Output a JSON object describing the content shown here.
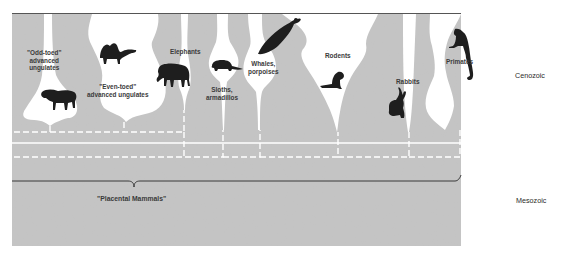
{
  "diagram": {
    "colors": {
      "background": "#c4c4c4",
      "lineage": "#ffffff",
      "silhouette": "#1e1e1e",
      "label": "#3a3a3a",
      "page": "#ffffff"
    },
    "eras": [
      {
        "id": "cenozoic",
        "label": "Cenozoic"
      },
      {
        "id": "mesozoic",
        "label": "Mesozoic"
      }
    ],
    "groups": [
      {
        "id": "odd-toed",
        "label_line1": "\"Odd-toed\"",
        "label_line2": "advanced",
        "label_line3": "ungulates",
        "icon": "tapir-icon"
      },
      {
        "id": "even-toed",
        "label_line1": "\"Even-toed\"",
        "label_line2": "advanced ungulates",
        "icon": "camel-icon"
      },
      {
        "id": "elephants",
        "label_line1": "Elephants",
        "icon": "elephant-icon"
      },
      {
        "id": "sloths",
        "label_line1": "Sloths,",
        "label_line2": "armadillos",
        "icon": "armadillo-icon"
      },
      {
        "id": "whales",
        "label_line1": "Whales,",
        "label_line2": "porpoises",
        "icon": "whale-icon"
      },
      {
        "id": "rodents",
        "label_line1": "Rodents",
        "icon": "chipmunk-icon"
      },
      {
        "id": "rabbits",
        "label_line1": "Rabbits",
        "icon": "rabbit-icon"
      },
      {
        "id": "primates",
        "label_line1": "Primates",
        "icon": "monkey-icon"
      }
    ],
    "root": {
      "label": "\"Placental Mammals\""
    }
  }
}
